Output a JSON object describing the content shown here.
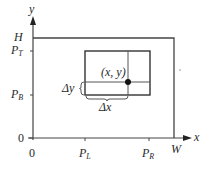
{
  "diagram": {
    "axes": {
      "x_label": "x",
      "y_label": "y",
      "origin_x_label": "0",
      "origin_y_label": "0"
    },
    "y_ticks": [
      {
        "label": "H",
        "sub": ""
      },
      {
        "label": "P",
        "sub": "T"
      },
      {
        "label": "P",
        "sub": "B"
      }
    ],
    "x_ticks": [
      {
        "label": "P",
        "sub": "L"
      },
      {
        "label": "P",
        "sub": "R"
      },
      {
        "label": "W",
        "sub": ""
      }
    ],
    "outer_rect": {
      "name": "screen",
      "width_label": "W",
      "height_label": "H"
    },
    "inner_rect": {
      "name": "pixel-region",
      "left": "P_L",
      "right": "P_R",
      "top": "P_T",
      "bottom": "P_B"
    },
    "point_label": "(x, y)",
    "delta_x_label": "Δx",
    "delta_y_label": "Δy",
    "colors": {
      "line": "#3a3a3a",
      "text": "#2a2a2a",
      "background": "#ffffff"
    }
  }
}
